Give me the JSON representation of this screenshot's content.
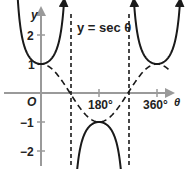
{
  "chart_data": {
    "type": "line",
    "title": "y = sec θ",
    "xlabel": "θ",
    "ylabel": "y",
    "origin_label": "O",
    "x_ticks": [
      {
        "value": 180,
        "label": "180°"
      },
      {
        "value": 360,
        "label": "360°"
      }
    ],
    "y_ticks": [
      {
        "value": 2,
        "label": "2"
      },
      {
        "value": 1,
        "label": "1"
      },
      {
        "value": -1,
        "label": "−1"
      },
      {
        "value": -2,
        "label": "−2"
      }
    ],
    "xlim": [
      -80,
      440
    ],
    "ylim": [
      -2.4,
      3.2
    ],
    "asymptotes": [
      90,
      270
    ],
    "series": [
      {
        "name": "y = sec θ",
        "style": "solid",
        "function": "sec",
        "branches": [
          [
            -78,
            72
          ],
          [
            108,
            252
          ],
          [
            288,
            432
          ]
        ]
      },
      {
        "name": "y = cos θ",
        "style": "dashed",
        "function": "cos",
        "domain": [
          -10,
          400
        ]
      }
    ],
    "annotations": [
      "y = sec θ"
    ],
    "grid": false,
    "legend": null
  },
  "labels": {
    "title": "y = sec θ",
    "y_axis": "y",
    "x_axis": "θ",
    "origin": "O",
    "tick_180": "180°",
    "tick_360": "360°",
    "tick_y2": "2",
    "tick_y1": "1",
    "tick_ym1": "−1",
    "tick_ym2": "−2"
  }
}
